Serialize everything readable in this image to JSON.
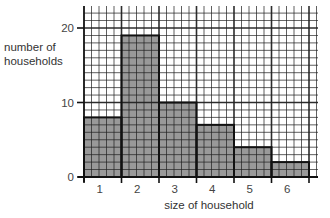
{
  "chart_data": {
    "type": "bar",
    "title": "",
    "xlabel": "size of household",
    "ylabel": "number of households",
    "categories": [
      "1",
      "2",
      "3",
      "4",
      "5",
      "6"
    ],
    "values": [
      8,
      19,
      10,
      7,
      4,
      2
    ],
    "ylim": [
      0,
      23
    ],
    "yticks": [
      0,
      10,
      20
    ],
    "grid": true,
    "minor_grid_y_step": 1,
    "minor_grid_x_per_bar": 5,
    "bar_color": "#999999",
    "grid_color": "#222222",
    "legend": null
  },
  "labels": {
    "ylabel_line1": "number of",
    "ylabel_line2": "households",
    "xlabel": "size of household"
  }
}
